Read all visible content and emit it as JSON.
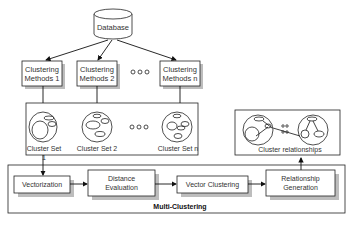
{
  "database": {
    "label": "Database"
  },
  "methods": [
    {
      "line1": "Clustering",
      "line2": "Methods 1"
    },
    {
      "line1": "Clustering",
      "line2": "Methods 2"
    },
    {
      "line1": "Clustering",
      "line2": "Methods n"
    }
  ],
  "ellipsis": "○○○",
  "cluster_sets": [
    "Cluster Set 1",
    "Cluster Set 2",
    "Cluster Set n"
  ],
  "relationships": {
    "label": "Cluster relationships"
  },
  "pipeline": {
    "title": "Multi-Clustering",
    "steps": [
      {
        "line1": "Vectorization",
        "line2": ""
      },
      {
        "line1": "Distance",
        "line2": "Evaluation"
      },
      {
        "line1": "Vector Clustering",
        "line2": ""
      },
      {
        "line1": "Relationship",
        "line2": "Generation"
      }
    ]
  }
}
